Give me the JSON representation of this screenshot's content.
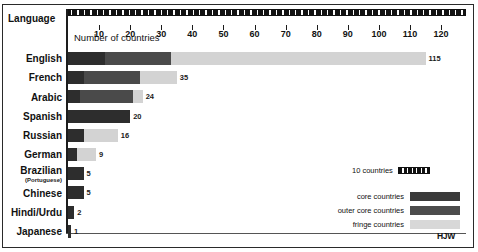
{
  "corner_label": "Language",
  "signature": "HJW",
  "legend": {
    "scale_label": "10 countries",
    "keys": [
      {
        "label": "core countries",
        "swatch": "core",
        "color": "#3a3a3a"
      },
      {
        "label": "outer core countries",
        "swatch": "outer",
        "color": "#4c4c4c"
      },
      {
        "label": "fringe countries",
        "swatch": "fringe",
        "color": "#d8d8d8"
      }
    ]
  },
  "chart_data": {
    "type": "bar",
    "orientation": "horizontal",
    "stacked": true,
    "title": "",
    "xlabel": "Number of countries",
    "ylabel": "Language",
    "xlim": [
      0,
      128
    ],
    "grid": false,
    "legend_position": "bottom-right",
    "tick_values": [
      10,
      20,
      30,
      40,
      50,
      60,
      70,
      80,
      90,
      100,
      110,
      120
    ],
    "tick_labels": [
      "10",
      "20",
      "30",
      "40",
      "50",
      "60",
      "70",
      "80",
      "90",
      "100",
      "110",
      "120"
    ],
    "categories": [
      "English",
      "French",
      "Arabic",
      "Spanish",
      "Russian",
      "German",
      "Brazilian",
      "Chinese",
      "Hindi/Urdu",
      "Japanese"
    ],
    "category_sublabels": {
      "Brazilian": "(Portuguese)"
    },
    "series": [
      {
        "name": "core countries",
        "color": "#2d2d2d",
        "values": [
          12,
          5,
          4,
          20,
          5,
          3,
          5,
          5,
          2,
          1
        ]
      },
      {
        "name": "outer core countries",
        "color": "#4a4a4a",
        "values": [
          21,
          18,
          17,
          0,
          0,
          0,
          0,
          0,
          0,
          0
        ]
      },
      {
        "name": "fringe countries",
        "color": "#d3d3d3",
        "values": [
          82,
          12,
          3,
          0,
          11,
          6,
          0,
          0,
          0,
          0
        ]
      }
    ],
    "totals": [
      115,
      35,
      24,
      20,
      16,
      9,
      5,
      5,
      2,
      1
    ],
    "value_labels": [
      "115",
      "35",
      "24",
      "20",
      "16",
      "9",
      "5",
      "5",
      "2",
      "1"
    ]
  }
}
